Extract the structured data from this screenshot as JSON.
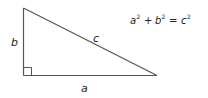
{
  "diagram": {
    "labels": {
      "side_a": "a",
      "side_b": "b",
      "side_c": "c"
    },
    "equation": {
      "a": "a",
      "b": "b",
      "c": "c",
      "exp": "2",
      "plus": "+",
      "equals": "="
    },
    "colors": {
      "stroke": "#555555",
      "text": "#222222"
    }
  }
}
